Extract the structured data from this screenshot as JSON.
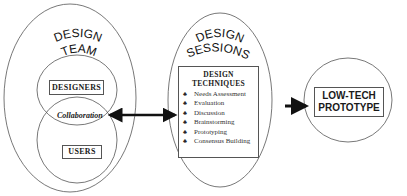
{
  "design_team": {
    "title_line1": "DESIGN",
    "title_line2": "TEAM",
    "designers_label": "DESIGNERS",
    "collaboration_label": "Collaboration",
    "users_label": "USERS"
  },
  "design_sessions": {
    "title_line1": "DESIGN",
    "title_line2": "SESSIONS",
    "techniques_title_line1": "DESIGN",
    "techniques_title_line2": "TECHNIQUES",
    "bullet_icon": "♣",
    "techniques": [
      "Needs Assessment",
      "Evaluation",
      "Discussion",
      "Brainstorming",
      "Prototyping",
      "Consensus Building"
    ]
  },
  "low_tech_prototype": {
    "line1": "LOW-TECH",
    "line2": "PROTOTYPE"
  },
  "colors": {
    "stroke": "#555555",
    "arrow": "#111111",
    "background": "#ffffff"
  }
}
